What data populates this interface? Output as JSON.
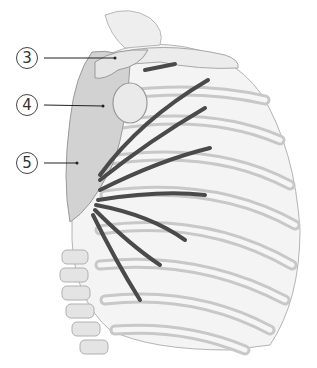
{
  "figure": {
    "colors": {
      "bone_fill": "#ececec",
      "bone_outline": "#b4b4b4",
      "scapula_fill": "#cfcfcf",
      "muscle": "#4a4a4a",
      "leader_line": "#222222",
      "background": "#ffffff"
    }
  },
  "labels": [
    {
      "number": "3",
      "cx": 27,
      "cy": 58,
      "line_end_x": 115,
      "line_end_y": 58
    },
    {
      "number": "4",
      "cx": 27,
      "cy": 105,
      "line_end_x": 103,
      "line_end_y": 106
    },
    {
      "number": "5",
      "cx": 27,
      "cy": 163,
      "line_end_x": 77,
      "line_end_y": 163
    }
  ]
}
